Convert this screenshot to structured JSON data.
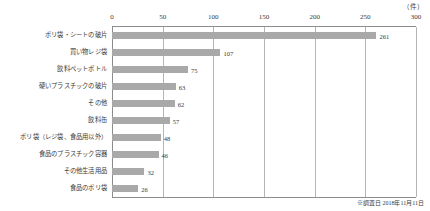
{
  "chart_data": {
    "type": "bar",
    "orientation": "horizontal",
    "title": "",
    "subtitle": "",
    "xlabel": "",
    "ylabel": "",
    "unit_label": "（件）",
    "xlim": [
      0,
      300
    ],
    "xticks": [
      0,
      50,
      100,
      150,
      200,
      250,
      300
    ],
    "xtick_labels": [
      "0",
      "50",
      "100",
      "150",
      "200",
      "250",
      "300"
    ],
    "grid": true,
    "grid_axis": "x",
    "legend": false,
    "axis_top": true,
    "bar_color": "#a9a9a9",
    "categories": [
      "ポリ袋・シートの破片",
      "買い物レジ袋",
      "飲料ペットボトル",
      "硬いプラスチックの破片",
      "その他",
      "飲料缶",
      "ポリ袋（レジ袋、食品用以外）",
      "食品のプラスチック容器",
      "その他生活用品",
      "食品のポリ袋"
    ],
    "values": [
      261,
      107,
      75,
      63,
      62,
      57,
      48,
      46,
      32,
      26
    ],
    "annotations": [
      "※調査日 2018年11月11日"
    ]
  },
  "footnote": "※調査日 2018年11月11日"
}
